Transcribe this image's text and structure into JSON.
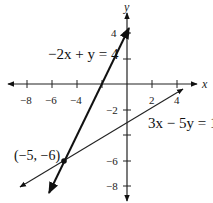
{
  "graph": {
    "x_axis_label": "x",
    "y_axis_label": "y",
    "x_ticks": [
      {
        "value": -8,
        "label": "−8"
      },
      {
        "value": -6,
        "label": "−6"
      },
      {
        "value": -4,
        "label": "−4"
      },
      {
        "value": -2,
        "label": ""
      },
      {
        "value": 2,
        "label": "2"
      },
      {
        "value": 4,
        "label": "4"
      }
    ],
    "y_ticks": [
      {
        "value": 4,
        "label": "4"
      },
      {
        "value": 2,
        "label": ""
      },
      {
        "value": -2,
        "label": "−2"
      },
      {
        "value": -4,
        "label": ""
      },
      {
        "value": -6,
        "label": "−6"
      },
      {
        "value": -8,
        "label": "−8"
      }
    ],
    "lines": [
      {
        "equation": "−2x + y = 4",
        "style": "bold",
        "color": "#111111"
      },
      {
        "equation": "3x − 5y = 15",
        "style": "thin",
        "color": "#222222"
      }
    ],
    "intersection": {
      "label": "(−5, −6)",
      "x": -5,
      "y": -6
    },
    "points": [
      {
        "x": 0,
        "y": 4
      },
      {
        "x": -5,
        "y": -6
      }
    ]
  }
}
